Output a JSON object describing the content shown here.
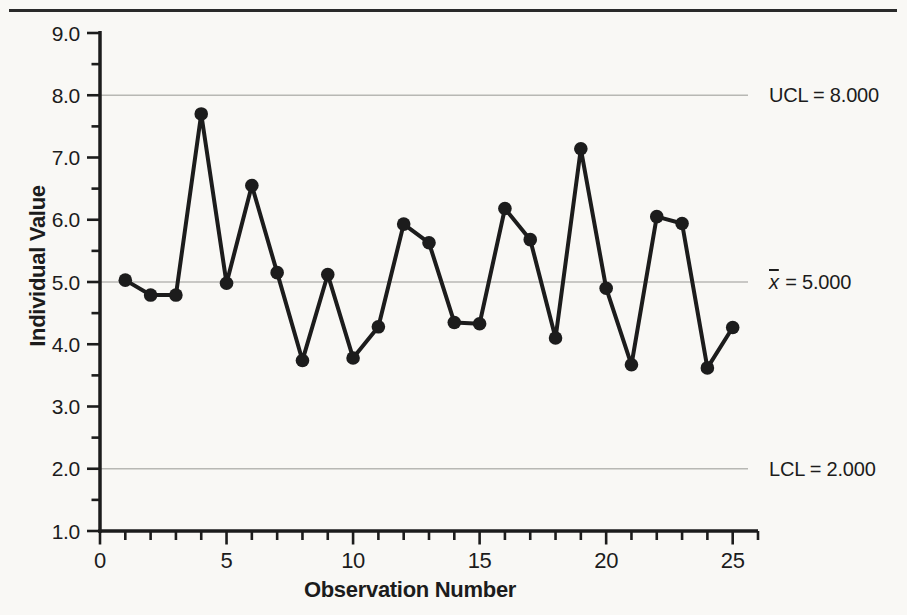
{
  "chart_data": {
    "type": "line",
    "xlabel": "Observation Number",
    "ylabel": "Individual Value",
    "x": [
      1,
      2,
      3,
      4,
      5,
      6,
      7,
      8,
      9,
      10,
      11,
      12,
      13,
      14,
      15,
      16,
      17,
      18,
      19,
      20,
      21,
      22,
      23,
      24,
      25
    ],
    "values": [
      5.03,
      4.79,
      4.79,
      7.7,
      4.98,
      6.55,
      5.15,
      3.74,
      5.12,
      3.78,
      4.28,
      5.93,
      5.63,
      4.35,
      4.33,
      6.18,
      5.68,
      4.1,
      7.14,
      4.9,
      3.67,
      6.05,
      5.94,
      3.62,
      4.27
    ],
    "xlim": [
      0,
      26
    ],
    "ylim": [
      1.0,
      9.0
    ],
    "x_major_ticks": [
      0,
      5,
      10,
      15,
      20,
      25
    ],
    "x_tick_labels": [
      "0",
      "5",
      "10",
      "15",
      "20",
      "25"
    ],
    "x_minor_tick_step": 1,
    "y_major_ticks": [
      1,
      2,
      3,
      4,
      5,
      6,
      7,
      8,
      9
    ],
    "y_tick_labels": [
      "1.0",
      "2.0",
      "3.0",
      "4.0",
      "5.0",
      "6.0",
      "7.0",
      "8.0",
      "9.0"
    ],
    "y_minor_tick_step": 0.5,
    "grid": "horizontal reference lines only",
    "legend": "none",
    "marker": "filled-circle",
    "reference_lines": [
      {
        "name": "UCL",
        "value": 8.0,
        "label": "UCL = 8.000"
      },
      {
        "name": "x-bar",
        "value": 5.0,
        "label_symbol": "x",
        "label_rest": " = 5.000"
      },
      {
        "name": "LCL",
        "value": 2.0,
        "label": "LCL = 2.000"
      }
    ],
    "colors": {
      "series": "#1c1c1c",
      "grid": "#b8b8b4",
      "axis": "#1c1c1c",
      "background": "#f9f8f5",
      "top_rule": "#2a2a2a"
    }
  }
}
